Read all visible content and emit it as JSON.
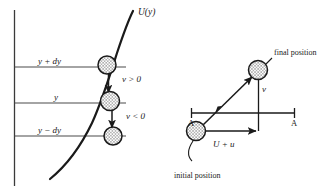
{
  "figure": {
    "background_color": "#ffffff",
    "ink_color": "#1a1a1a",
    "width": 323,
    "height": 195
  },
  "left_panel": {
    "curve_label": "U(y)",
    "axis_levels": [
      {
        "label": "y + dy",
        "y_px": 67
      },
      {
        "label": "y",
        "y_px": 103
      },
      {
        "label": "y − dy",
        "y_px": 136
      }
    ],
    "velocity_labels": [
      {
        "label": "v > 0",
        "position": "upper"
      },
      {
        "label": "v < 0",
        "position": "lower"
      }
    ],
    "balls": [
      {
        "name": "ball-upper",
        "cx": 107,
        "cy": 65
      },
      {
        "name": "ball-middle",
        "cx": 110,
        "cy": 101
      },
      {
        "name": "ball-lower",
        "cx": 113,
        "cy": 136
      }
    ]
  },
  "right_panel": {
    "final_position_label": "final position",
    "initial_position_label": "initial position",
    "velocity_label": "v",
    "horizontal_label": "U + u",
    "section_label_left": "A",
    "section_label_right": "A",
    "balls": [
      {
        "name": "ball-initial",
        "cx": 196,
        "cy": 131
      },
      {
        "name": "ball-final",
        "cx": 258,
        "cy": 70
      }
    ]
  }
}
